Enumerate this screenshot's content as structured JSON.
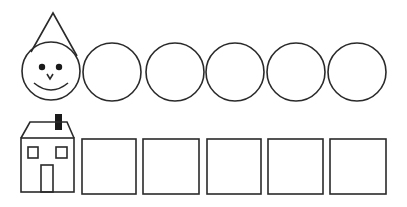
{
  "canvas": {
    "width": 407,
    "height": 207,
    "background": "#ffffff",
    "stroke_color": "#2a2a2a"
  },
  "top_row": {
    "label": "circles",
    "face": {
      "cx": 51,
      "cy": 71,
      "r": 29,
      "eyes": [
        [
          42,
          67
        ],
        [
          59,
          67
        ]
      ],
      "eye_r": 3.2
    },
    "hat": {
      "apex": [
        53,
        13
      ],
      "left": [
        31,
        52
      ],
      "right": [
        77,
        56
      ]
    },
    "circles": [
      {
        "cx": 112,
        "cy": 72,
        "r": 29
      },
      {
        "cx": 175,
        "cy": 72,
        "r": 29
      },
      {
        "cx": 235,
        "cy": 72,
        "r": 29
      },
      {
        "cx": 296,
        "cy": 72,
        "r": 29
      },
      {
        "cx": 357,
        "cy": 72,
        "r": 29
      }
    ]
  },
  "bottom_row": {
    "label": "squares",
    "house": {
      "body": {
        "x": 21,
        "y": 138,
        "w": 53,
        "h": 54
      },
      "roof": [
        [
          21,
          138
        ],
        [
          30,
          122
        ],
        [
          67,
          122
        ],
        [
          74,
          138
        ]
      ],
      "chimney": {
        "x": 55,
        "y": 114,
        "w": 7,
        "h": 16
      },
      "windows": [
        {
          "x": 28,
          "y": 147,
          "w": 10,
          "h": 11
        },
        {
          "x": 56,
          "y": 147,
          "w": 11,
          "h": 11
        }
      ],
      "door": {
        "x": 41,
        "y": 165,
        "w": 12,
        "h": 27
      }
    },
    "squares": [
      {
        "x": 82,
        "y": 139,
        "w": 54,
        "h": 55
      },
      {
        "x": 143,
        "y": 139,
        "w": 56,
        "h": 55
      },
      {
        "x": 207,
        "y": 139,
        "w": 54,
        "h": 55
      },
      {
        "x": 268,
        "y": 139,
        "w": 55,
        "h": 55
      },
      {
        "x": 330,
        "y": 139,
        "w": 56,
        "h": 55
      }
    ]
  }
}
